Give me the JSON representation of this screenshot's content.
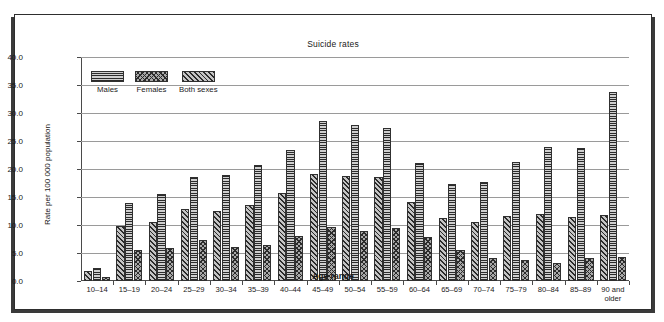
{
  "figure": {
    "title": "Suicide rates"
  },
  "legend": {
    "position": "top-left-inside",
    "items": [
      {
        "label": "Males",
        "pattern": "horizontal-lines"
      },
      {
        "label": "Females",
        "pattern": "cross-hatch"
      },
      {
        "label": "Both sexes",
        "pattern": "diagonal-lines"
      }
    ]
  },
  "chart_data": {
    "type": "bar",
    "title": "Suicide rates",
    "xlabel": "Age range",
    "ylabel": "Rate per 100 000 population",
    "ylim": [
      0.0,
      40.0
    ],
    "ytick_step": 5.0,
    "ytick_labels": [
      "0.0",
      "5.0",
      "10.0",
      "15.0",
      "20.0",
      "25.0",
      "30.0",
      "35.0",
      "40.0"
    ],
    "grid": "horizontal",
    "bar_order_in_group": [
      "Both sexes",
      "Males",
      "Females"
    ],
    "categories": [
      "10–14",
      "15–19",
      "20–24",
      "25–29",
      "30–34",
      "35–39",
      "40–44",
      "45–49",
      "50–54",
      "55–59",
      "60–64",
      "65–69",
      "70–74",
      "75–79",
      "80–84",
      "85–89",
      "90 and older"
    ],
    "series": [
      {
        "name": "Males",
        "pattern": "horizontal-lines",
        "values": [
          2.3,
          14.0,
          15.6,
          18.5,
          18.9,
          20.8,
          23.4,
          28.6,
          27.9,
          27.3,
          21.0,
          17.4,
          17.6,
          21.3,
          23.9,
          23.7,
          33.7
        ]
      },
      {
        "name": "Females",
        "pattern": "cross-hatch",
        "values": [
          0.8,
          5.5,
          5.9,
          7.4,
          6.1,
          6.5,
          8.0,
          9.6,
          9.0,
          9.4,
          7.8,
          5.5,
          4.1,
          3.8,
          3.2,
          4.1,
          4.2
        ]
      },
      {
        "name": "Both sexes",
        "pattern": "diagonal-lines",
        "values": [
          1.7,
          9.9,
          10.6,
          12.9,
          12.5,
          13.5,
          15.8,
          19.1,
          18.8,
          18.6,
          14.1,
          11.3,
          10.5,
          11.6,
          11.9,
          11.4,
          11.7
        ]
      }
    ]
  },
  "colors": {
    "frame": "#2e2e2e",
    "frame_shadow": "#3a3a3a",
    "grid": "#9a9a9a",
    "axis": "#4a4a4a",
    "ink": "#1a1a1a",
    "background": "#ffffff"
  }
}
